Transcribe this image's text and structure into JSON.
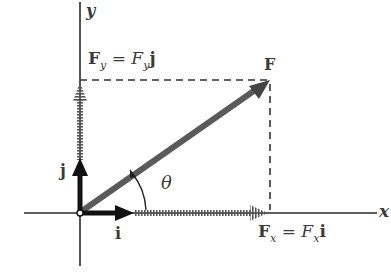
{
  "diagram": {
    "type": "vector-decomposition",
    "axes": {
      "x_label": "x",
      "y_label": "y"
    },
    "vectors": {
      "force": {
        "label": "F",
        "description": "force vector at angle theta"
      },
      "fx": {
        "lhs": "F",
        "lhs_sub": "x",
        "eq": "=",
        "rhs": "F",
        "rhs_sub": "x",
        "unit": "i"
      },
      "fy": {
        "lhs": "F",
        "lhs_sub": "y",
        "eq": "=",
        "rhs": "F",
        "rhs_sub": "y",
        "unit": "j"
      },
      "unit_i": {
        "label": "i"
      },
      "unit_j": {
        "label": "j"
      }
    },
    "angle": {
      "label": "θ"
    },
    "colors": {
      "axis": "#2a2a2a",
      "force": "#5a5a5a",
      "unit_vectors": "#111111",
      "hatched_components": "#6a6a6a",
      "dashed": "#333333",
      "text": "#3a3a3a"
    }
  }
}
